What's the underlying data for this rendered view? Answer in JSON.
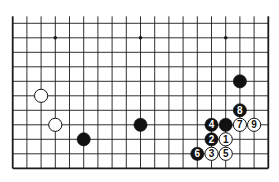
{
  "board": {
    "columns": 19,
    "rows": 11,
    "origin_x": 12.7,
    "origin_y": 23.3,
    "spacing_x": 14.2,
    "spacing_y": 14.5,
    "top_extension": 7,
    "edges": {
      "left": true,
      "right": true,
      "bottom": true,
      "top": false
    },
    "line_color": "#1a1a1a",
    "background": "#ffffff"
  },
  "star_points": [
    {
      "col": 3,
      "row": 1
    },
    {
      "col": 9,
      "row": 1
    },
    {
      "col": 15,
      "row": 1
    }
  ],
  "stones": [
    {
      "color": "black",
      "col": 16,
      "row": 4,
      "label": ""
    },
    {
      "color": "white",
      "col": 2,
      "row": 5,
      "label": ""
    },
    {
      "color": "white",
      "col": 3,
      "row": 7,
      "label": ""
    },
    {
      "color": "black",
      "col": 5,
      "row": 8,
      "label": ""
    },
    {
      "color": "black",
      "col": 9,
      "row": 7,
      "label": ""
    },
    {
      "color": "black",
      "col": 15,
      "row": 7,
      "label": ""
    },
    {
      "color": "white",
      "col": 15,
      "row": 8,
      "label": "1"
    },
    {
      "color": "black",
      "col": 14,
      "row": 8,
      "label": "2"
    },
    {
      "color": "white",
      "col": 14,
      "row": 9,
      "label": "3"
    },
    {
      "color": "black",
      "col": 14,
      "row": 7,
      "label": "4"
    },
    {
      "color": "white",
      "col": 15,
      "row": 9,
      "label": "5"
    },
    {
      "color": "black",
      "col": 13,
      "row": 9,
      "label": "6"
    },
    {
      "color": "white",
      "col": 16,
      "row": 7,
      "label": "7"
    },
    {
      "color": "black",
      "col": 16,
      "row": 6,
      "label": "8"
    },
    {
      "color": "white",
      "col": 17,
      "row": 7,
      "label": "9"
    }
  ]
}
